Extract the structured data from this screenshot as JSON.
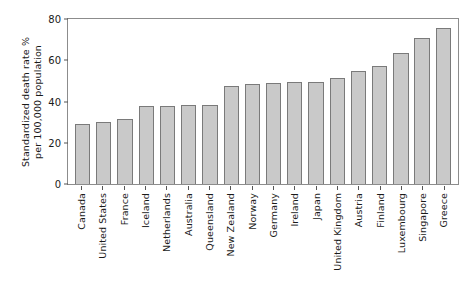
{
  "chart_data": {
    "type": "bar",
    "title": "",
    "xlabel": "",
    "ylabel_line1": "Standardized death rate %",
    "ylabel_line2": "per 100,000 population",
    "ylim": [
      0,
      80
    ],
    "yticks": [
      80,
      60,
      40,
      20,
      0
    ],
    "grid": false,
    "legend": "none",
    "orientation": "vertical",
    "bar_fill_color": "#c9c9c9",
    "bar_edge_color": "#7a7a7a",
    "categories": [
      "Canada",
      "United States",
      "France",
      "Iceland",
      "Netherlands",
      "Australia",
      "Queensland",
      "New Zealand",
      "Norway",
      "Germany",
      "Ireland",
      "Japan",
      "United Kingdom",
      "Austria",
      "Finland",
      "Luxembourg",
      "Singapore",
      "Greece"
    ],
    "values": [
      29,
      30,
      31.5,
      38,
      38,
      38.5,
      38.5,
      47.5,
      48.5,
      49,
      49.5,
      49.5,
      51.5,
      55,
      57,
      63.5,
      71,
      75.5
    ]
  }
}
